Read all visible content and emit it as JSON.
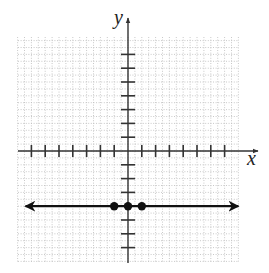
{
  "chart_data": {
    "type": "line",
    "title": "",
    "xlabel": "x",
    "ylabel": "y",
    "xlim": [
      -7.5,
      8.5
    ],
    "ylim": [
      -8,
      8
    ],
    "grid": true,
    "grid_style": "dotted",
    "x_ticks": [
      -7,
      -6,
      -5,
      -4,
      -3,
      -2,
      -1,
      1,
      2,
      3,
      4,
      5,
      6,
      7
    ],
    "y_ticks": [
      -7,
      -6,
      -5,
      -3,
      -2,
      -1,
      1,
      2,
      3,
      4,
      5,
      6,
      7
    ],
    "series": [
      {
        "name": "y = -4",
        "kind": "horizontal-line",
        "y": -4,
        "arrows": "both",
        "x": [
          -7.5,
          8
        ],
        "values": [
          -4,
          -4
        ]
      },
      {
        "name": "plotted points",
        "kind": "scatter",
        "points": [
          [
            -1,
            -4
          ],
          [
            0,
            -4
          ],
          [
            1,
            -4
          ]
        ]
      }
    ]
  },
  "labels": {
    "x_axis": "x",
    "y_axis": "y"
  },
  "colors": {
    "axis": "#333333",
    "grid": "#bbbbbb",
    "line": "#111111"
  }
}
